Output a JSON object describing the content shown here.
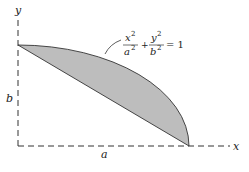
{
  "diagram": {
    "axes": {
      "x_label": "x",
      "y_label": "y"
    },
    "dimensions": {
      "horizontal": "a",
      "vertical": "b"
    },
    "equation": {
      "term1_num": "x",
      "term1_num_exp": "2",
      "term1_den": "a",
      "term1_den_exp": "2",
      "plus": "+",
      "term2_num": "y",
      "term2_num_exp": "2",
      "term2_den": "b",
      "term2_den_exp": "2",
      "rhs": "= 1"
    },
    "region": {
      "description": "Shaded region between chord from (0,b) to (a,0) and the ellipse arc",
      "fill_color": "#bdbdbd",
      "stroke_color": "#333333"
    }
  }
}
